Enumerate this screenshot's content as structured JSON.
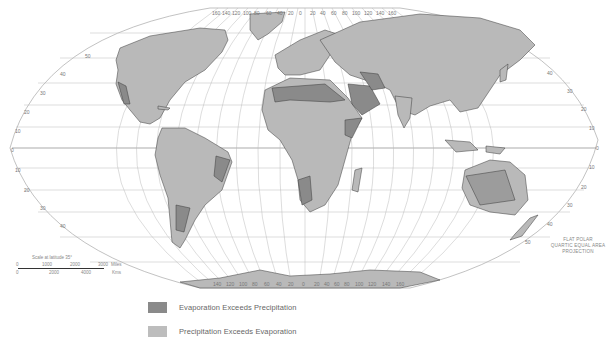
{
  "map": {
    "projection_label": [
      "FLAT POLAR",
      "QUARTIC EQUAL AREA",
      "PROJECTION"
    ],
    "scale": {
      "title": "Scale at latitude 35°",
      "miles_ticks": [
        "0",
        "1000",
        "2000",
        "3000"
      ],
      "miles_unit": "Miles",
      "km_ticks": [
        "0",
        "2000",
        "4000"
      ],
      "km_unit": "Kms"
    },
    "latitude_labels_left": [
      "50",
      "40",
      "30",
      "20",
      "10",
      "0",
      "10",
      "20",
      "30",
      "40"
    ],
    "latitude_labels_right": [
      "40",
      "30",
      "20",
      "10",
      "0",
      "10",
      "20",
      "30",
      "40",
      "50"
    ],
    "longitude_labels_top": [
      "160",
      "140",
      "120",
      "100",
      "80",
      "60",
      "40",
      "20",
      "0",
      "20",
      "40",
      "60",
      "80",
      "100",
      "120",
      "140",
      "160"
    ],
    "longitude_labels_bottom": [
      "140",
      "120",
      "100",
      "80",
      "60",
      "40",
      "20",
      "0",
      "20",
      "40",
      "60",
      "80",
      "100",
      "120",
      "140",
      "160"
    ],
    "colors": {
      "ocean": "#ffffff",
      "graticule": "#b8b8b8",
      "land_precip": "#b9b9b9",
      "land_evap": "#8a8a8a",
      "border": "#3a3a3a"
    }
  },
  "legend": {
    "items": [
      {
        "label": "Evaporation Exceeds Precipitation",
        "color": "#8a8a8a"
      },
      {
        "label": "Precipitation Exceeds Evaporation",
        "color": "#bdbdbd"
      }
    ]
  }
}
